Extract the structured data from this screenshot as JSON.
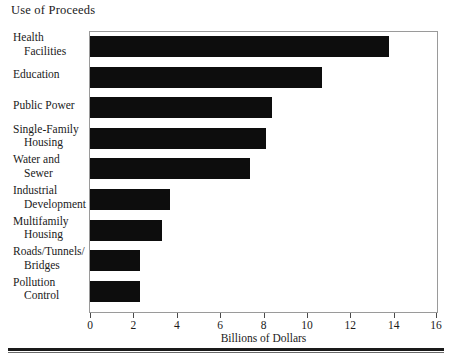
{
  "chart_data": {
    "type": "bar",
    "orientation": "horizontal",
    "title": "Use of Proceeds",
    "xlabel": "Billions of Dollars",
    "ylabel": "",
    "xlim": [
      0,
      16
    ],
    "xticks": [
      0,
      2,
      4,
      6,
      8,
      10,
      12,
      14,
      16
    ],
    "xtick_labels": [
      "0",
      "2",
      "4",
      "6",
      "8",
      "10",
      "12",
      "14",
      "16"
    ],
    "grid": false,
    "legend": null,
    "bar_color": "#0d0d0d",
    "categories": [
      "Health Facilities",
      "Education",
      "Public Power",
      "Single-Family Housing",
      "Water and Sewer",
      "Industrial Development",
      "Multifamily Housing",
      "Roads/Tunnels/Bridges",
      "Pollution Control"
    ],
    "category_lines": [
      [
        "Health",
        "Facilities"
      ],
      [
        "Education"
      ],
      [
        "Public Power"
      ],
      [
        "Single-Family",
        "Housing"
      ],
      [
        "Water and",
        "Sewer"
      ],
      [
        "Industrial",
        "Development"
      ],
      [
        "Multifamily",
        "Housing"
      ],
      [
        "Roads/Tunnels/",
        "Bridges"
      ],
      [
        "Pollution",
        "Control"
      ]
    ],
    "values": [
      13.8,
      10.7,
      8.4,
      8.1,
      7.4,
      3.7,
      3.3,
      2.3,
      2.3
    ]
  }
}
